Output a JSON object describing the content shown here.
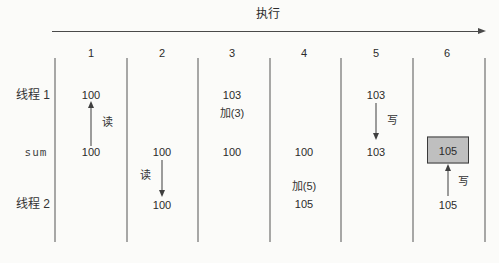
{
  "axis": {
    "label": "执行"
  },
  "steps": [
    "1",
    "2",
    "3",
    "4",
    "5",
    "6"
  ],
  "row_labels": {
    "thread1": "线程 1",
    "sum": "sum",
    "thread2": "线程 2"
  },
  "ops": {
    "read": "读",
    "write": "写",
    "add3": "加(3)",
    "add5": "加(5)"
  },
  "values": {
    "thread1_step1": "100",
    "sum_step1": "100",
    "sum_step2": "100",
    "thread2_step2": "100",
    "thread1_step3": "103",
    "sum_step3": "100",
    "sum_step4": "100",
    "thread2_step4": "105",
    "thread1_step5": "103",
    "sum_step5": "103",
    "sum_step6": "105",
    "thread2_step6": "105"
  },
  "colors": {
    "line": "#3f3f3f",
    "highlight_fill": "#bfbfbf",
    "highlight_border": "#3a3a3a",
    "background": "#fbfbf9"
  }
}
